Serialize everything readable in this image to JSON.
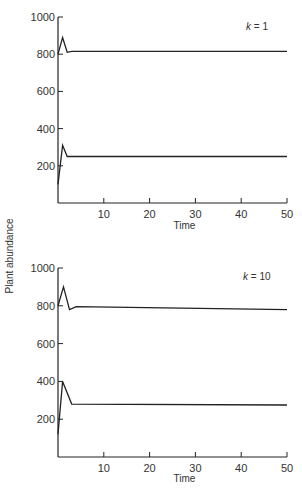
{
  "figure": {
    "ylabel": "Plant abundance",
    "xlabel": "Time"
  },
  "chart_data": [
    {
      "type": "line",
      "title": "k = 1",
      "xlabel": "Time",
      "ylabel": "Plant abundance",
      "xlim": [
        0,
        50
      ],
      "ylim": [
        0,
        1000
      ],
      "xticks": [
        10,
        20,
        30,
        40,
        50
      ],
      "yticks": [
        200,
        400,
        600,
        800,
        1000
      ],
      "grid": false,
      "annotation": {
        "var": "k",
        "eq": " = ",
        "val": "1"
      },
      "series": [
        {
          "name": "upper",
          "x": [
            0,
            1,
            2,
            3,
            50
          ],
          "y": [
            800,
            890,
            810,
            815,
            815
          ]
        },
        {
          "name": "lower",
          "x": [
            0,
            1,
            2,
            3,
            50
          ],
          "y": [
            100,
            310,
            250,
            250,
            250
          ]
        }
      ]
    },
    {
      "type": "line",
      "title": "k = 10",
      "xlabel": "Time",
      "ylabel": "Plant abundance",
      "xlim": [
        0,
        50
      ],
      "ylim": [
        0,
        1000
      ],
      "xticks": [
        10,
        20,
        30,
        40,
        50
      ],
      "yticks": [
        200,
        400,
        600,
        800,
        1000
      ],
      "grid": false,
      "annotation": {
        "var": "k",
        "eq": " = ",
        "val": "10"
      },
      "series": [
        {
          "name": "upper",
          "x": [
            0,
            1.2,
            2.5,
            4,
            50
          ],
          "y": [
            800,
            900,
            780,
            795,
            780
          ]
        },
        {
          "name": "lower",
          "x": [
            0,
            1,
            3,
            50
          ],
          "y": [
            120,
            400,
            280,
            275
          ]
        }
      ]
    }
  ]
}
